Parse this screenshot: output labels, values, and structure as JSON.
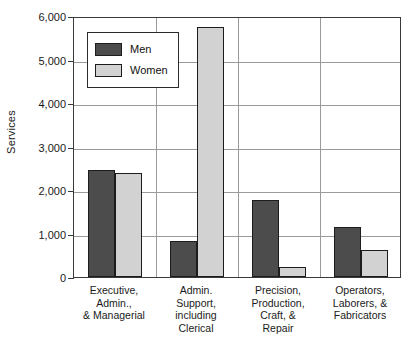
{
  "chart_data": {
    "type": "bar",
    "title": "",
    "xlabel": "",
    "ylabel": "Services",
    "ylim": [
      0,
      6000
    ],
    "ytick_values": [
      0,
      1000,
      2000,
      3000,
      4000,
      5000,
      6000
    ],
    "ytick_labels": [
      "0",
      "1,000",
      "2,000",
      "3,000",
      "4,000",
      "5,000",
      "6,000"
    ],
    "grid": "horizontal-and-vertical-group-separators",
    "legend_position": "upper-left-inside",
    "categories": [
      "Executive, Admin., & Managerial",
      "Admin. Support, including Clerical",
      "Precision, Production, Craft, & Repair",
      "Operators, Laborers, & Fabricators"
    ],
    "category_label_lines": [
      [
        "Executive,",
        "Admin.,",
        "& Managerial"
      ],
      [
        "Admin.",
        "Support,",
        "including",
        "Clerical"
      ],
      [
        "Precision,",
        "Production,",
        "Craft, &",
        "Repair"
      ],
      [
        "Operators,",
        "Laborers, &",
        "Fabricators"
      ]
    ],
    "series": [
      {
        "name": "Men",
        "color": "#4c4c4c",
        "values": [
          2470,
          830,
          1770,
          1150
        ]
      },
      {
        "name": "Women",
        "color": "#d2d2d2",
        "values": [
          2400,
          5750,
          230,
          630
        ]
      }
    ]
  },
  "legend": {
    "items": [
      {
        "label": "Men"
      },
      {
        "label": "Women"
      }
    ]
  },
  "axis": {
    "y_title": "Services",
    "y_labels": [
      "6,000",
      "5,000",
      "4,000",
      "3,000",
      "2,000",
      "1,000",
      "0"
    ]
  }
}
